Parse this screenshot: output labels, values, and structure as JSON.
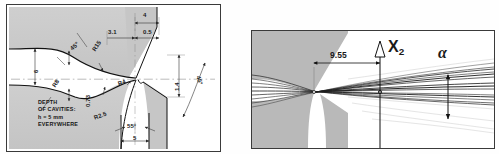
{
  "figure": {
    "type": "engineering-drawing-pair",
    "panels": [
      {
        "id": "left",
        "name": "die-cavity-cross-section",
        "note": {
          "line1": "DEPTH",
          "line2": "OF CAVITIES:",
          "line3": "h = 5 mm",
          "line4": "EVERYWHERE"
        },
        "dimensions": [
          {
            "name": "width-4",
            "label": "4"
          },
          {
            "name": "offset-3-1",
            "label": "3.1"
          },
          {
            "name": "gap-0-5",
            "label": "0.5"
          },
          {
            "name": "height-6",
            "label": "6"
          },
          {
            "name": "throat-0-73",
            "label": "0.73"
          },
          {
            "name": "land-1-4",
            "label": "1.4"
          },
          {
            "name": "exit-width-5",
            "label": "5"
          }
        ],
        "radii": [
          {
            "name": "radius-r15",
            "label": "R15"
          },
          {
            "name": "radius-r8",
            "label": "R8"
          },
          {
            "name": "radius-r4",
            "label": "R4"
          },
          {
            "name": "radius-r25",
            "label": "R2.5"
          }
        ],
        "angles": [
          {
            "name": "angle-45-upper",
            "label": "45°"
          },
          {
            "name": "angle-45-right",
            "label": "45°"
          },
          {
            "name": "angle-55-lower",
            "label": "55°"
          }
        ]
      },
      {
        "id": "right",
        "name": "flow-streamline-photo",
        "labels": [
          {
            "name": "distance-9-55",
            "label": "9.55"
          },
          {
            "name": "axis-label-x2",
            "label": "X",
            "subscript": "2"
          },
          {
            "name": "angle-alpha",
            "label": "α"
          }
        ]
      }
    ]
  },
  "colors": {
    "frame": "#3a3a3a",
    "material_fill": "#c9c9c9",
    "material_fill_light": "#d8d8d8",
    "line": "#1a1a1a",
    "dim_line": "#444444",
    "background": "#ffffff",
    "streamline": "#202020"
  }
}
